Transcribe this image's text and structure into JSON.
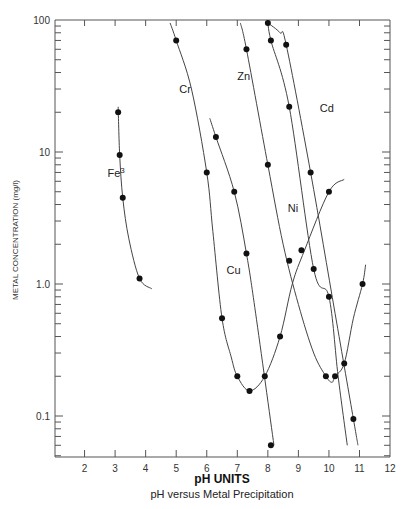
{
  "chart_data": {
    "type": "line",
    "title": "",
    "caption": "pH versus Metal Precipitation",
    "xlabel": "pH UNITS",
    "ylabel": "METAL CONCENTRATION (mg/l)",
    "yscale": "log",
    "xlim": [
      1,
      12
    ],
    "ylim": [
      0.05,
      100
    ],
    "x_ticks": [
      2,
      3,
      4,
      5,
      6,
      7,
      8,
      9,
      10,
      11,
      12
    ],
    "y_ticks": [
      0.1,
      1.0,
      10,
      100
    ],
    "y_tick_labels": [
      "0.1",
      "1.0",
      "10",
      "100"
    ],
    "grid": false,
    "legend": "inline labels",
    "series": [
      {
        "name": "Fe3",
        "label": "Fe",
        "label_sup": "3",
        "points": [
          [
            3.1,
            20
          ],
          [
            3.15,
            9.5
          ],
          [
            3.25,
            4.5
          ],
          [
            3.8,
            1.1
          ]
        ],
        "curve": [
          [
            3.1,
            22
          ],
          [
            3.15,
            9.5
          ],
          [
            3.25,
            4.5
          ],
          [
            3.45,
            2.2
          ],
          [
            3.8,
            1.1
          ],
          [
            4.2,
            0.92
          ]
        ]
      },
      {
        "name": "Cr",
        "label": "Cr",
        "points": [
          [
            5.0,
            70
          ],
          [
            6.0,
            7.0
          ],
          [
            6.5,
            0.55
          ],
          [
            7.0,
            0.2
          ],
          [
            7.4,
            0.155
          ],
          [
            7.9,
            0.2
          ],
          [
            8.4,
            0.4
          ],
          [
            10.0,
            5.0
          ]
        ],
        "curve": [
          [
            4.8,
            95
          ],
          [
            5.0,
            70
          ],
          [
            5.5,
            30
          ],
          [
            6.0,
            7.0
          ],
          [
            6.2,
            2.5
          ],
          [
            6.5,
            0.55
          ],
          [
            6.8,
            0.28
          ],
          [
            7.0,
            0.2
          ],
          [
            7.4,
            0.155
          ],
          [
            7.9,
            0.2
          ],
          [
            8.4,
            0.4
          ],
          [
            8.8,
            1.0
          ],
          [
            9.2,
            1.8
          ],
          [
            10.0,
            5.0
          ],
          [
            10.5,
            6.2
          ]
        ]
      },
      {
        "name": "Cu",
        "label": "Cu",
        "points": [
          [
            6.3,
            13
          ],
          [
            6.9,
            5.0
          ],
          [
            7.3,
            1.7
          ],
          [
            8.1,
            0.06
          ]
        ],
        "curve": [
          [
            6.1,
            18
          ],
          [
            6.3,
            13
          ],
          [
            6.9,
            5.0
          ],
          [
            7.3,
            1.7
          ],
          [
            7.6,
            0.6
          ],
          [
            8.2,
            0.06
          ]
        ]
      },
      {
        "name": "Zn",
        "label": "Zn",
        "points": [
          [
            7.3,
            60
          ],
          [
            8.0,
            8.0
          ],
          [
            8.7,
            1.5
          ],
          [
            9.1,
            1.8
          ],
          [
            9.9,
            0.2
          ],
          [
            10.2,
            0.2
          ],
          [
            10.5,
            0.25
          ],
          [
            11.1,
            1.0
          ]
        ],
        "curve": [
          [
            7.1,
            95
          ],
          [
            7.3,
            60
          ],
          [
            8.0,
            8.0
          ],
          [
            8.5,
            2.0
          ],
          [
            9.0,
            0.7
          ],
          [
            9.5,
            0.3
          ],
          [
            9.9,
            0.2
          ],
          [
            10.1,
            0.18
          ],
          [
            10.2,
            0.2
          ],
          [
            10.5,
            0.25
          ],
          [
            10.8,
            0.55
          ],
          [
            11.1,
            1.0
          ],
          [
            11.2,
            1.4
          ]
        ]
      },
      {
        "name": "Ni",
        "label": "Ni",
        "points": [
          [
            8.1,
            70
          ],
          [
            8.7,
            22
          ],
          [
            9.5,
            1.3
          ],
          [
            10.0,
            0.8
          ]
        ],
        "curve": [
          [
            8.0,
            100
          ],
          [
            8.1,
            70
          ],
          [
            8.7,
            22
          ],
          [
            9.5,
            1.3
          ],
          [
            10.0,
            0.8
          ],
          [
            10.3,
            0.2
          ],
          [
            10.6,
            0.06
          ]
        ]
      },
      {
        "name": "Cd",
        "label": "Cd",
        "points": [
          [
            8.0,
            95
          ],
          [
            8.6,
            65
          ],
          [
            9.4,
            7.0
          ],
          [
            10.8,
            0.095
          ]
        ],
        "curve": [
          [
            8.0,
            95
          ],
          [
            8.4,
            80
          ],
          [
            8.6,
            65
          ],
          [
            9.4,
            7.0
          ],
          [
            10.2,
            0.6
          ],
          [
            10.8,
            0.095
          ],
          [
            10.95,
            0.06
          ]
        ]
      }
    ],
    "labels": [
      {
        "text": "Fe",
        "sup": "3",
        "x": 2.75,
        "y": 6.5
      },
      {
        "text": "Cr",
        "x": 5.1,
        "y": 28
      },
      {
        "text": "Zn",
        "x": 7.0,
        "y": 35
      },
      {
        "text": "Cd",
        "x": 9.7,
        "y": 20
      },
      {
        "text": "Ni",
        "x": 8.65,
        "y": 3.5
      },
      {
        "text": "Cu",
        "x": 6.65,
        "y": 1.2
      }
    ]
  }
}
